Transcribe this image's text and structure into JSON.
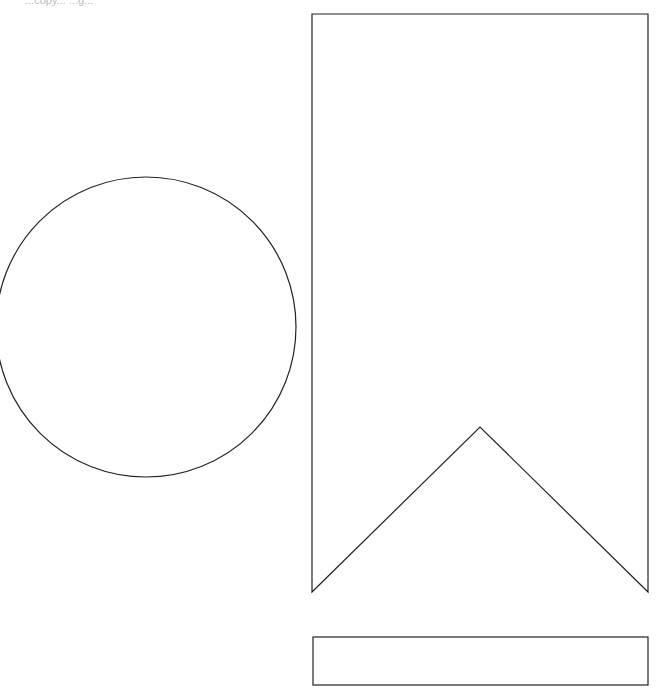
{
  "canvas": {
    "width": 657,
    "height": 690,
    "background": "#ffffff",
    "stroke": "#222222"
  },
  "caption": "...copy... ...g...",
  "shapes": {
    "circle": {
      "cx": 146,
      "cy": 327,
      "r": 150
    },
    "banner": {
      "points": "312,14 648,14 648,592 480,427 312,592"
    },
    "rect": {
      "x": 313,
      "y": 637,
      "width": 335,
      "height": 48
    }
  }
}
